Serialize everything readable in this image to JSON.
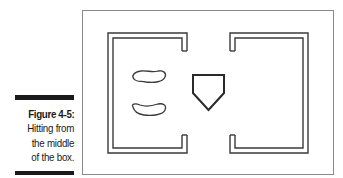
{
  "caption": {
    "title": "Figure 4-5:",
    "lines": [
      "Hitting from",
      "the middle",
      "of the box."
    ]
  },
  "diagram": {
    "elements": [
      "left-batters-box",
      "right-batters-box",
      "left-footprint",
      "right-footprint",
      "home-plate"
    ],
    "stroke_color": "#3a3a3a",
    "frame_color": "#8a8a8a"
  }
}
